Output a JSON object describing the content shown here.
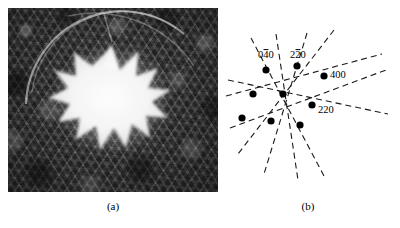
{
  "figure": {
    "panels": [
      {
        "id": "a",
        "caption": "(a)",
        "kind": "micrograph",
        "description": "dark mottled crystalline background with bright star-shaped defect and faint diffraction arcs"
      },
      {
        "id": "b",
        "caption": "(b)",
        "kind": "schematic-diffraction-pattern",
        "description": "array of reflection spots with dashed trace lines"
      }
    ]
  },
  "chart_data": {
    "type": "scatter",
    "title": "",
    "xlabel": "",
    "ylabel": "",
    "grid": false,
    "legend": null,
    "spots": [
      {
        "name": "spot-040",
        "x": 42,
        "y": 62,
        "label": "040",
        "bar_index": 1
      },
      {
        "name": "spot-220bar",
        "x": 73,
        "y": 58,
        "label": "220",
        "bar_index": 1
      },
      {
        "name": "spot-400",
        "x": 100,
        "y": 68,
        "label": "400",
        "bar_index": -1
      },
      {
        "name": "spot-left",
        "x": 29,
        "y": 86,
        "label": "",
        "bar_index": -1
      },
      {
        "name": "spot-center",
        "x": 59,
        "y": 86,
        "label": "",
        "bar_index": -1
      },
      {
        "name": "spot-220",
        "x": 88,
        "y": 97,
        "label": "220",
        "bar_index": -1
      },
      {
        "name": "spot-lower-l",
        "x": 18,
        "y": 110,
        "label": "",
        "bar_index": -1
      },
      {
        "name": "spot-lower-m",
        "x": 47,
        "y": 113,
        "label": "",
        "bar_index": -1
      },
      {
        "name": "spot-lower-r",
        "x": 76,
        "y": 117,
        "label": "",
        "bar_index": -1
      }
    ],
    "trace_lines": [
      {
        "name": "trace-1",
        "x1": 27,
        "y1": 30,
        "x2": 100,
        "y2": 168
      },
      {
        "name": "trace-2",
        "x1": 52,
        "y1": 26,
        "x2": 74,
        "y2": 172
      },
      {
        "name": "trace-3",
        "x1": 83,
        "y1": 25,
        "x2": 40,
        "y2": 166
      },
      {
        "name": "trace-4",
        "x1": 4,
        "y1": 72,
        "x2": 164,
        "y2": 106
      },
      {
        "name": "trace-5",
        "x1": 2,
        "y1": 88,
        "x2": 158,
        "y2": 46
      },
      {
        "name": "trace-6",
        "x1": 6,
        "y1": 120,
        "x2": 162,
        "y2": 62
      },
      {
        "name": "trace-7",
        "x1": 110,
        "y1": 22,
        "x2": 14,
        "y2": 146
      }
    ],
    "labels": [
      {
        "name": "label-040",
        "text": "040",
        "x": 34,
        "y": 50,
        "overbar_char": 1
      },
      {
        "name": "label-220bar",
        "text": "220",
        "x": 66,
        "y": 50,
        "overbar_char": 1
      },
      {
        "name": "label-400",
        "text": "400",
        "x": 106,
        "y": 70,
        "overbar_char": -1
      },
      {
        "name": "label-220",
        "text": "220",
        "x": 94,
        "y": 105,
        "overbar_char": -1
      }
    ]
  },
  "colors": {
    "ink": "#000000",
    "page": "#ffffff",
    "micrograph_dark": "#2f2f2f",
    "micrograph_bright": "#f2f2f2"
  }
}
